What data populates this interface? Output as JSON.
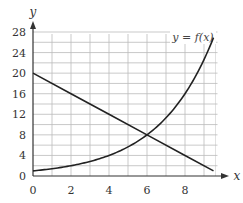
{
  "chart_data": {
    "type": "line",
    "title": "",
    "xlabel": "x",
    "ylabel": "y",
    "xlim": [
      0,
      9.5
    ],
    "ylim": [
      0,
      28
    ],
    "x_ticks": [
      "0",
      "2",
      "4",
      "6",
      "8"
    ],
    "y_ticks": [
      "0",
      "4",
      "8",
      "12",
      "16",
      "20",
      "24",
      "28"
    ],
    "grid": true,
    "annotations": [
      "y = f(x)"
    ],
    "series": [
      {
        "name": "line y = 20 - 2x",
        "x": [
          0,
          2,
          4,
          6,
          8,
          9.5
        ],
        "y": [
          20,
          16,
          12,
          8,
          4,
          1
        ]
      },
      {
        "name": "y = f(x)",
        "x": [
          0,
          1,
          2,
          3,
          4,
          5,
          6,
          7,
          8,
          9,
          9.5
        ],
        "y": [
          1,
          1.4,
          2,
          2.8,
          4,
          5.7,
          8,
          11.3,
          16,
          22.6,
          26.9
        ]
      }
    ],
    "intersection": {
      "x": 6,
      "y": 8
    }
  },
  "labels": {
    "x_axis": "x",
    "y_axis": "y",
    "curve_label": "y = f(x)"
  }
}
